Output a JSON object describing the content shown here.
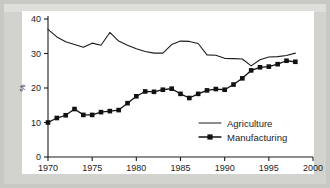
{
  "figure": {
    "background_color": "#c9c9c4",
    "panel_color": "#ffffff",
    "ink_color": "#1c1c1c"
  },
  "axes": {
    "y_title": "%",
    "y_ticks": [
      "0",
      "10",
      "20",
      "30",
      "40"
    ],
    "x_ticks": [
      "1970",
      "1975",
      "1980",
      "1985",
      "1990",
      "1995",
      "2000"
    ]
  },
  "legend": {
    "items": [
      {
        "label": "Agriculture",
        "marker": "none"
      },
      {
        "label": "Manufacturing",
        "marker": "square"
      }
    ]
  },
  "chart_data": {
    "type": "line",
    "title": "",
    "xlabel": "",
    "ylabel": "%",
    "xlim": [
      1970,
      2000
    ],
    "ylim": [
      0,
      40
    ],
    "xticks": [
      1970,
      1975,
      1980,
      1985,
      1990,
      1995,
      2000
    ],
    "yticks": [
      0,
      10,
      20,
      30,
      40
    ],
    "grid": false,
    "legend_position": "inside lower right",
    "x": [
      1970,
      1971,
      1972,
      1973,
      1974,
      1975,
      1976,
      1977,
      1978,
      1979,
      1980,
      1981,
      1982,
      1983,
      1984,
      1985,
      1986,
      1987,
      1988,
      1989,
      1990,
      1991,
      1992,
      1993,
      1994,
      1995,
      1996,
      1997,
      1998
    ],
    "series": [
      {
        "name": "Agriculture",
        "marker": "none",
        "values": [
          37.0,
          34.8,
          33.4,
          32.6,
          31.8,
          33.0,
          32.4,
          36.1,
          33.6,
          32.4,
          31.4,
          30.6,
          30.1,
          30.1,
          32.6,
          33.6,
          33.5,
          32.9,
          29.6,
          29.5,
          28.6,
          28.5,
          28.4,
          26.4,
          28.2,
          29.0,
          29.1,
          29.4,
          30.1
        ]
      },
      {
        "name": "Manufacturing",
        "marker": "square",
        "values": [
          10.0,
          11.3,
          12.1,
          13.9,
          12.2,
          12.2,
          13.0,
          13.3,
          13.6,
          15.6,
          17.6,
          19.0,
          18.9,
          19.5,
          19.8,
          18.3,
          17.1,
          18.3,
          19.3,
          19.7,
          19.5,
          21.0,
          22.8,
          25.1,
          26.0,
          26.2,
          26.9,
          27.9,
          27.6
        ]
      }
    ]
  }
}
